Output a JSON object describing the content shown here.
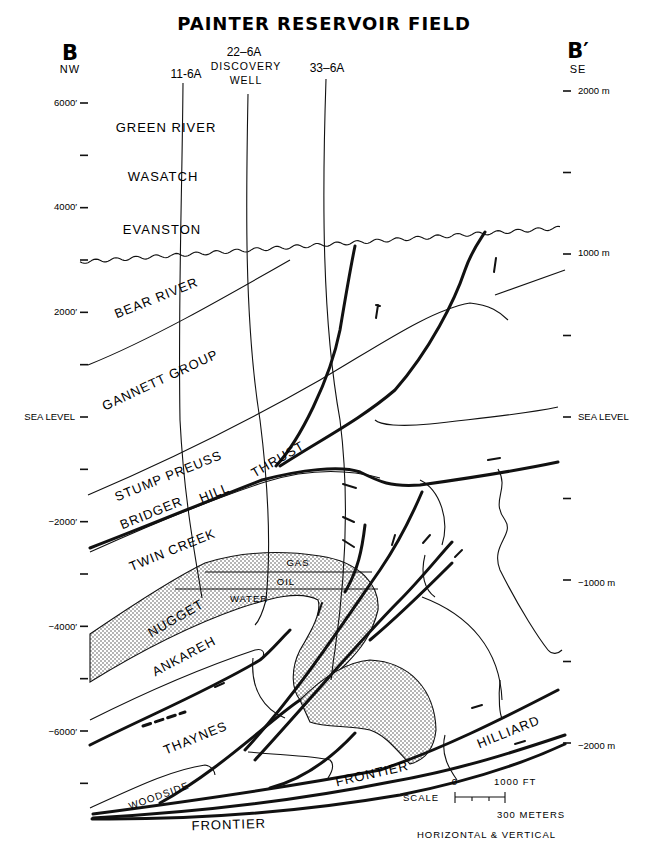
{
  "title": "PAINTER RESERVOIR FIELD",
  "section": {
    "left_end": {
      "label": "B",
      "direction": "NW"
    },
    "right_end": {
      "label": "B′",
      "direction": "SE"
    }
  },
  "wells": [
    {
      "name": "11-6A",
      "note": ""
    },
    {
      "name": "22–6A",
      "note_line1": "DISCOVERY",
      "note_line2": "WELL"
    },
    {
      "name": "33–6A",
      "note": ""
    }
  ],
  "left_axis": {
    "unit": "feet",
    "labels": [
      "6000′",
      "4000′",
      "2000′",
      "SEA LEVEL",
      "−2000′",
      "−4000′",
      "−6000′"
    ],
    "values_ft": [
      6000,
      4000,
      2000,
      0,
      -2000,
      -4000,
      -6000
    ],
    "minor_tick_interval_ft": 1000
  },
  "right_axis": {
    "unit": "meters",
    "labels": [
      "2000 m",
      "1000 m",
      "SEA LEVEL",
      "−1000 m",
      "−2000 m"
    ],
    "values_m": [
      2000,
      1000,
      0,
      -1000,
      -2000
    ],
    "minor_tick_interval_m": 500
  },
  "formations": {
    "green_river": "GREEN RIVER",
    "wasatch": "WASATCH",
    "evanston": "EVANSTON",
    "bear_river": "BEAR RIVER",
    "gannett_group": "GANNETT GROUP",
    "stump_preuss": "STUMP PREUSS",
    "twin_creek": "TWIN CREEK",
    "nugget": "NUGGET",
    "ankareh": "ANKAREH",
    "thaynes": "THAYNES",
    "woodside": "WOODSIDE",
    "frontier_upper": "FRONTIER",
    "frontier_lower": "FRONTIER",
    "hilliard": "HILLIARD"
  },
  "fault": {
    "word1": "BRIDGER",
    "word2": "HILL",
    "word3": "THRUST"
  },
  "fluids": {
    "gas": "GAS",
    "oil": "OIL",
    "water": "WATER"
  },
  "scale": {
    "label": "SCALE",
    "zero": "0",
    "feet": "1000 FT",
    "meters": "300 METERS",
    "note": "HORIZONTAL & VERTICAL"
  }
}
